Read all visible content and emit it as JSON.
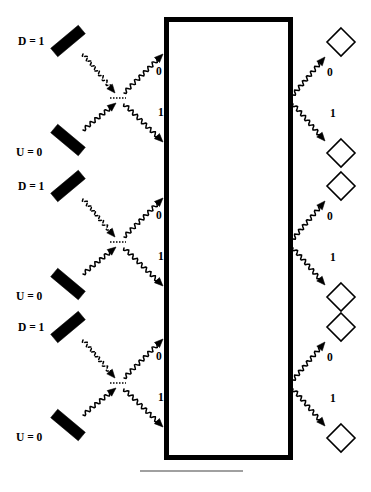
{
  "figure": {
    "type": "optics-schematic",
    "title": "",
    "background_color": "#ffffff",
    "ink_color": "#000000",
    "width": 371,
    "height": 492
  },
  "device_box": {
    "name": "central-device-box",
    "x": 166,
    "y": 19,
    "width": 124,
    "height": 438,
    "stroke_width": 5,
    "fill": "#ffffff",
    "stroke": "#000000",
    "label": ""
  },
  "baseline_rule": {
    "name": "bottom-rule",
    "x1": 140,
    "x2": 243,
    "y": 471,
    "stroke": "#808080",
    "stroke_width": 1.6
  },
  "cells": [
    {
      "id": "cell-1",
      "center_y": 98,
      "input_mirrors": [
        {
          "id": "mirror-d-top-1",
          "label": "D = 1",
          "label_x": 18,
          "label_y": 36,
          "bar_cx": 68,
          "bar_cy": 41,
          "angle": 40,
          "length": 36,
          "thickness": 11
        },
        {
          "id": "mirror-u-bottom-1",
          "label": "U = 0",
          "label_x": 16,
          "label_y": 147,
          "bar_cx": 68,
          "bar_cy": 140,
          "angle": -40,
          "length": 36,
          "thickness": 11
        }
      ],
      "beamsplitter": {
        "id": "beamsplitter-1",
        "x": 118,
        "y": 98,
        "width": 16,
        "stroke_dash": "1.5 1.5"
      },
      "in_beams": [
        {
          "id": "beam-in-d-1",
          "from": [
            83,
            54
          ],
          "to": [
            115,
            93
          ],
          "style": "dashed-wave",
          "label": ""
        },
        {
          "id": "beam-in-u-1",
          "from": [
            83,
            130
          ],
          "to": [
            116,
            103
          ],
          "style": "wave",
          "label": ""
        }
      ],
      "out_beams_to_box": [
        {
          "id": "beam-0-in-1",
          "from": [
            124,
            93
          ],
          "to": [
            163,
            54
          ],
          "style": "wave",
          "label": "0",
          "label_x": 156,
          "label_y": 66
        },
        {
          "id": "beam-1-in-1",
          "from": [
            124,
            104
          ],
          "to": [
            163,
            142
          ],
          "style": "wave",
          "label": "1",
          "label_x": 158,
          "label_y": 107
        }
      ],
      "out_beams_from_box": [
        {
          "id": "beam-0-out-1",
          "from": [
            293,
            95
          ],
          "to": [
            325,
            57
          ],
          "style": "wave",
          "label": "0",
          "label_x": 327,
          "label_y": 67
        },
        {
          "id": "beam-1-out-1",
          "from": [
            293,
            104
          ],
          "to": [
            325,
            141
          ],
          "style": "wave",
          "label": "1",
          "label_x": 330,
          "label_y": 108
        }
      ],
      "detectors": [
        {
          "id": "detector-0-1",
          "cx": 341,
          "cy": 42,
          "r": 14,
          "label": ""
        },
        {
          "id": "detector-1-1",
          "cx": 341,
          "cy": 153,
          "r": 14,
          "label": ""
        }
      ]
    },
    {
      "id": "cell-2",
      "center_y": 242,
      "input_mirrors": [
        {
          "id": "mirror-d-top-2",
          "label": "D = 1",
          "label_x": 18,
          "label_y": 181,
          "bar_cx": 68,
          "bar_cy": 186,
          "angle": 40,
          "length": 36,
          "thickness": 11
        },
        {
          "id": "mirror-u-bottom-2",
          "label": "U = 0",
          "label_x": 16,
          "label_y": 291,
          "bar_cx": 68,
          "bar_cy": 284,
          "angle": -40,
          "length": 36,
          "thickness": 11
        }
      ],
      "beamsplitter": {
        "id": "beamsplitter-2",
        "x": 118,
        "y": 242,
        "width": 16,
        "stroke_dash": "1.5 1.5"
      },
      "in_beams": [
        {
          "id": "beam-in-d-2",
          "from": [
            83,
            199
          ],
          "to": [
            115,
            237
          ],
          "style": "dashed-wave",
          "label": ""
        },
        {
          "id": "beam-in-u-2",
          "from": [
            83,
            274
          ],
          "to": [
            116,
            247
          ],
          "style": "wave",
          "label": ""
        }
      ],
      "out_beams_to_box": [
        {
          "id": "beam-0-in-2",
          "from": [
            124,
            237
          ],
          "to": [
            163,
            198
          ],
          "style": "wave",
          "label": "0",
          "label_x": 156,
          "label_y": 210
        },
        {
          "id": "beam-1-in-2",
          "from": [
            124,
            248
          ],
          "to": [
            163,
            286
          ],
          "style": "wave",
          "label": "1",
          "label_x": 158,
          "label_y": 251
        }
      ],
      "out_beams_from_box": [
        {
          "id": "beam-0-out-2",
          "from": [
            293,
            239
          ],
          "to": [
            325,
            201
          ],
          "style": "wave",
          "label": "0",
          "label_x": 327,
          "label_y": 211
        },
        {
          "id": "beam-1-out-2",
          "from": [
            293,
            248
          ],
          "to": [
            325,
            285
          ],
          "style": "wave",
          "label": "1",
          "label_x": 330,
          "label_y": 252
        }
      ],
      "detectors": [
        {
          "id": "detector-0-2",
          "cx": 341,
          "cy": 186,
          "r": 14,
          "label": ""
        },
        {
          "id": "detector-1-2",
          "cx": 341,
          "cy": 297,
          "r": 14,
          "label": ""
        }
      ]
    },
    {
      "id": "cell-3",
      "center_y": 383,
      "input_mirrors": [
        {
          "id": "mirror-d-top-3",
          "label": "D = 1",
          "label_x": 18,
          "label_y": 322,
          "bar_cx": 68,
          "bar_cy": 327,
          "angle": 40,
          "length": 36,
          "thickness": 11
        },
        {
          "id": "mirror-u-bottom-3",
          "label": "U = 0",
          "label_x": 16,
          "label_y": 432,
          "bar_cx": 68,
          "bar_cy": 425,
          "angle": -40,
          "length": 36,
          "thickness": 11
        }
      ],
      "beamsplitter": {
        "id": "beamsplitter-3",
        "x": 118,
        "y": 383,
        "width": 16,
        "stroke_dash": "1.5 1.5"
      },
      "in_beams": [
        {
          "id": "beam-in-d-3",
          "from": [
            83,
            340
          ],
          "to": [
            115,
            378
          ],
          "style": "dashed-wave",
          "label": ""
        },
        {
          "id": "beam-in-u-3",
          "from": [
            83,
            415
          ],
          "to": [
            116,
            388
          ],
          "style": "wave",
          "label": ""
        }
      ],
      "out_beams_to_box": [
        {
          "id": "beam-0-in-3",
          "from": [
            124,
            378
          ],
          "to": [
            163,
            339
          ],
          "style": "wave",
          "label": "0",
          "label_x": 156,
          "label_y": 351
        },
        {
          "id": "beam-1-in-3",
          "from": [
            124,
            389
          ],
          "to": [
            163,
            427
          ],
          "style": "wave",
          "label": "1",
          "label_x": 158,
          "label_y": 392
        }
      ],
      "out_beams_from_box": [
        {
          "id": "beam-0-out-3",
          "from": [
            293,
            380
          ],
          "to": [
            325,
            342
          ],
          "style": "wave",
          "label": "0",
          "label_x": 327,
          "label_y": 352
        },
        {
          "id": "beam-1-out-3",
          "from": [
            293,
            389
          ],
          "to": [
            325,
            426
          ],
          "style": "wave",
          "label": "1",
          "label_x": 330,
          "label_y": 393
        }
      ],
      "detectors": [
        {
          "id": "detector-0-3",
          "cx": 341,
          "cy": 327,
          "r": 14,
          "label": ""
        },
        {
          "id": "detector-1-3",
          "cx": 341,
          "cy": 438,
          "r": 14,
          "label": ""
        }
      ]
    }
  ],
  "legend": {
    "mirror_up_label": "U = 0",
    "mirror_down_label": "D = 1",
    "output_zero_label": "0",
    "output_one_label": "1"
  }
}
